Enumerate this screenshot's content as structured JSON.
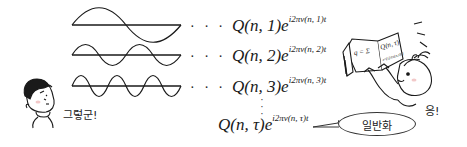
{
  "figure": {
    "waves": [
      {
        "id": "wave-1",
        "periods": 1,
        "baseline_y": 25,
        "amplitude": 11,
        "x_start": 72,
        "x_end": 181
      },
      {
        "id": "wave-2",
        "periods": 2,
        "baseline_y": 55,
        "amplitude": 11,
        "x_start": 72,
        "x_end": 181
      },
      {
        "id": "wave-3",
        "periods": 3,
        "baseline_y": 86,
        "amplitude": 11,
        "x_start": 72,
        "x_end": 181
      }
    ],
    "formulas": [
      {
        "dots": "· · ·",
        "coef": "Q(n, 1)",
        "base": "e",
        "exponent": "i2πν(n, 1)t"
      },
      {
        "dots": "· · ·",
        "coef": "Q(n, 2)",
        "base": "e",
        "exponent": "i2πν(n, 2)t"
      },
      {
        "dots": "· · ·",
        "coef": "Q(n, 3)",
        "base": "e",
        "exponent": "i2πν(n, 3)t"
      },
      {
        "dots": "",
        "coef": "Q(n, τ)",
        "base": "e",
        "exponent": "i2πν(n, τ)t"
      }
    ],
    "vertical_ellipsis": "·\n·\n·",
    "boy_speech": "그렇군!",
    "girl_speech": "응!",
    "bubble_label": "일반화",
    "book": {
      "left_page": "q = Σ",
      "right_page": "Q(n, τ)",
      "right_page_sub": "e^{i2πν(n,τ)t}"
    }
  },
  "colors": {
    "ink": "#1a1a1a",
    "background": "#ffffff",
    "cheek": "#f2c9c9"
  }
}
